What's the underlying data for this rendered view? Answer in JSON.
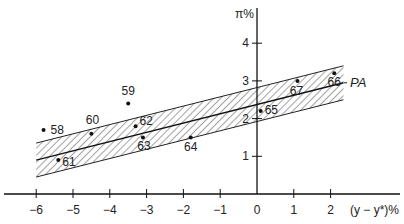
{
  "chart_data": {
    "type": "scatter",
    "title": "",
    "xlabel": "(y − y*)%",
    "ylabel": "π%",
    "xlim": [
      -6.8,
      3.9
    ],
    "ylim": [
      0,
      5
    ],
    "x_ticks": [
      -6,
      -5,
      -4,
      -3,
      -2,
      -1,
      0,
      1,
      2
    ],
    "x_tick_labels": [
      "−6",
      "−5",
      "−4",
      "−3",
      "−2",
      "−1",
      "0",
      "1",
      "2"
    ],
    "y_ticks": [
      1,
      2,
      3,
      4
    ],
    "y_tick_labels": [
      "1",
      "2",
      "3",
      "4"
    ],
    "grid": false,
    "legend": null,
    "points": [
      {
        "label": "58",
        "x": -5.8,
        "y": 1.7
      },
      {
        "label": "59",
        "x": -3.5,
        "y": 2.4
      },
      {
        "label": "60",
        "x": -4.5,
        "y": 1.6
      },
      {
        "label": "61",
        "x": -5.4,
        "y": 0.9
      },
      {
        "label": "62",
        "x": -3.3,
        "y": 1.8
      },
      {
        "label": "63",
        "x": -3.1,
        "y": 1.5
      },
      {
        "label": "64",
        "x": -1.8,
        "y": 1.5
      },
      {
        "label": "65",
        "x": 0.1,
        "y": 2.2
      },
      {
        "label": "66",
        "x": 2.1,
        "y": 3.2
      },
      {
        "label": "67",
        "x": 1.1,
        "y": 3.0
      }
    ],
    "line": {
      "label": "PA",
      "x": [
        -6.0,
        2.35
      ],
      "y": [
        0.9,
        2.95
      ],
      "band_halfwidth": 0.45,
      "band_fill": "diagonal-hatch"
    },
    "annotations": [
      "PA"
    ]
  },
  "labels": {
    "y_axis_title": "π%",
    "x_axis_title": "(y − y*)%",
    "pa": "PA"
  }
}
